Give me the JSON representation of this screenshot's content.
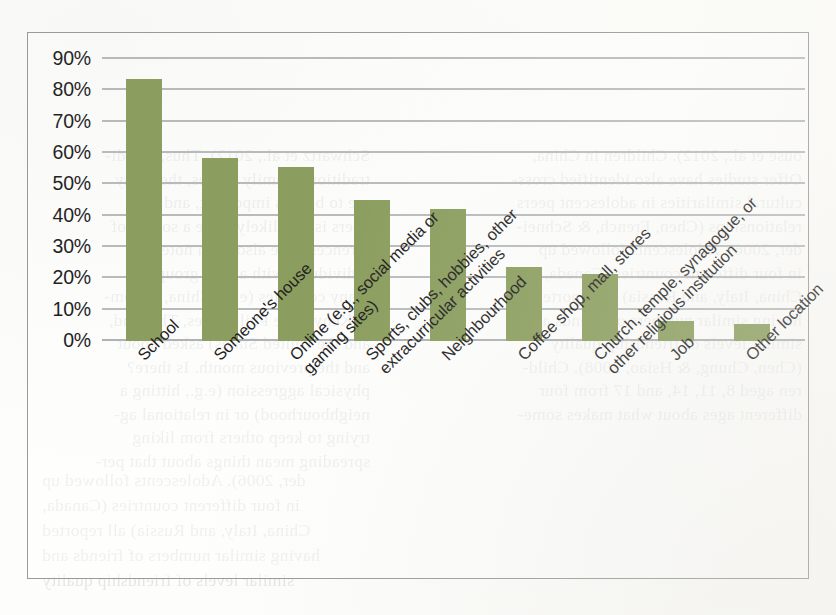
{
  "chart_data": {
    "type": "bar",
    "title": "",
    "subtitle": "",
    "xlabel": "",
    "ylabel": "",
    "ylim": [
      0,
      90
    ],
    "ytick_labels": [
      "90%",
      "80%",
      "70%",
      "60%",
      "50%",
      "40%",
      "30%",
      "20%",
      "10%",
      "0%"
    ],
    "ytick_values": [
      90,
      80,
      70,
      60,
      50,
      40,
      30,
      20,
      10,
      0
    ],
    "grid": "horizontal",
    "legend_position": "none",
    "bar_color": "#8b9e5e",
    "gridline_color": "#b9bcbd",
    "categories": [
      "School",
      "Someone's house",
      "Online (e.g., social media or\ngaming sites)",
      "Sports, clubs, hobbies, other\nextracurricular activities",
      "Neighbourhood",
      "Coffee shop, mall, stores",
      "Church, temple, synagogue, or\nother religious institution",
      "Job",
      "Other location"
    ],
    "values": [
      83.5,
      58.5,
      55.5,
      45,
      42,
      23.5,
      21.5,
      6.5,
      5.5
    ]
  },
  "scan_bleed": {
    "note": "reverse-side show-through text of a scanned book page",
    "lines": [
      "Schwartz et al., 2012). Thus, if indi-",
      "traditional family values, they may",
      "are to be less important, and so",
      "peers is less likely to be a source of",
      "ferences have also been noted in",
      "individuals with a peer group",
      "many countries (e.g., China, Colom-",
      "a, Kenya, the Philippines, Thailand,",
      "and the United States) asked about",
      "and the previous month. Is there?",
      "physical aggression (e.g., hitting a",
      "neighbourhood) or in relational ag-",
      "trying to keep others from liking",
      "spreading mean things about that per-",
      "ouse et al., 2012). Children in China,",
      "Offer studies have also identified cross-",
      "cultural similarities in adolescent peers",
      "relationships (Chen, French, & Schnei-",
      "der, 2006). Adolescents followed up",
      "in four different countries (Canada,",
      "China, Italy, and Russia) all reported",
      "having similar numbers of friends and",
      "similar levels of friendship quality",
      "(Chen, Chung, & Hsiao, 2008). Child-",
      "ren aged 8, 11, 14, and 17 from four",
      "different ages about what makes some-",
      "one a friend and why friends are important"
    ]
  }
}
